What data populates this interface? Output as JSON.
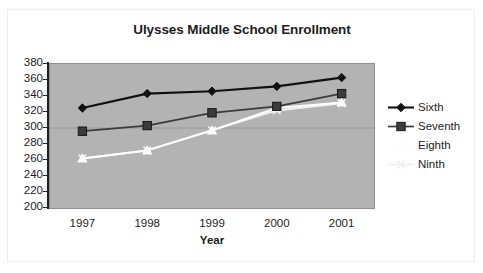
{
  "chart_data": {
    "type": "line",
    "title": "Ulysses Middle School Enrollment",
    "xlabel": "Year",
    "ylabel": "",
    "categories": [
      "1997",
      "1998",
      "1999",
      "2000",
      "2001"
    ],
    "x": [
      1997,
      1998,
      1999,
      2000,
      2001
    ],
    "ylim": [
      200,
      380
    ],
    "ytick_step": 20,
    "yticks": [
      380,
      360,
      340,
      320,
      300,
      280,
      260,
      240,
      220,
      200
    ],
    "ytick_labels": [
      "380",
      "360",
      "340",
      "320",
      "300",
      "280",
      "260",
      "240",
      "220",
      "200"
    ],
    "grid": "horizontal-single-at-300",
    "legend_position": "right",
    "plot_background": "#b3b3b3",
    "series": [
      {
        "name": "Sixth",
        "marker": "diamond",
        "color": "#111111",
        "values": [
          325,
          343,
          346,
          352,
          363
        ]
      },
      {
        "name": "Seventh",
        "marker": "square",
        "color": "#3b3b3b",
        "values": [
          296,
          303,
          319,
          327,
          343
        ]
      },
      {
        "name": "Eighth",
        "marker": "triangle",
        "color": "#fdfdfd",
        "values": [
          262,
          272,
          297,
          325,
          332
        ]
      },
      {
        "name": "Ninth",
        "marker": "x",
        "color": "#f0f0f0",
        "values": [
          262,
          272,
          297,
          322,
          331
        ]
      }
    ]
  },
  "legend": {
    "items": [
      {
        "label": "Sixth"
      },
      {
        "label": "Seventh"
      },
      {
        "label": "Eighth"
      },
      {
        "label": "Ninth"
      }
    ]
  }
}
